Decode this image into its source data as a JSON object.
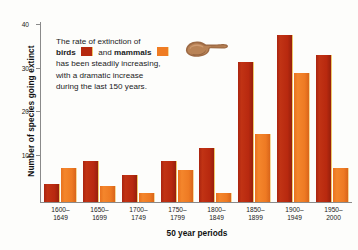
{
  "chart_data": {
    "type": "bar",
    "title": "",
    "xlabel": "50 year periods",
    "ylabel": "Number of species going extinct",
    "categories": [
      "1600–1649",
      "1650–1699",
      "1700–1749",
      "1750–1799",
      "1800–1849",
      "1850–1899",
      "1900–1949",
      "1950–2000"
    ],
    "series": [
      {
        "name": "birds",
        "color": "#b5280f",
        "values": [
          4,
          9,
          6,
          9,
          12,
          31,
          37,
          32.5
        ]
      },
      {
        "name": "mammals",
        "color": "#ef7c23",
        "values": [
          7.5,
          3.5,
          2,
          7,
          2,
          15,
          28.5,
          7.5
        ]
      }
    ],
    "ylim": [
      0,
      40
    ],
    "yticks": [
      10,
      20,
      30,
      40
    ],
    "ytick_labels": [
      "10",
      "20",
      "30",
      "40"
    ],
    "grid": false,
    "legend_position": "inline-annotation"
  },
  "axis": {
    "y_title": "Number of species going extinct",
    "x_title": "50 year periods",
    "y_ticks": [
      {
        "value": 40,
        "label": "40"
      },
      {
        "value": 30,
        "label": "30"
      },
      {
        "value": 20,
        "label": "20"
      },
      {
        "value": 10,
        "label": "10"
      }
    ],
    "x_categories": [
      {
        "line1": "1600–",
        "line2": "1649"
      },
      {
        "line1": "1650–",
        "line2": "1699"
      },
      {
        "line1": "1700–",
        "line2": "1749"
      },
      {
        "line1": "1750–",
        "line2": "1799"
      },
      {
        "line1": "1800–",
        "line2": "1849"
      },
      {
        "line1": "1850–",
        "line2": "1899"
      },
      {
        "line1": "1900–",
        "line2": "1949"
      },
      {
        "line1": "1950–",
        "line2": "2000"
      }
    ]
  },
  "annotation": {
    "line1_a": "The rate of extinction of",
    "line2_a": "birds",
    "line2_b": "and",
    "line2_c": "mammals",
    "line3": "has been steadily increasing,",
    "line4": "with a dramatic increase",
    "line5": "during the last 150 years."
  },
  "icons": {
    "pointing_hand": "pointing-hand-icon"
  },
  "colors": {
    "birds": "#b5280f",
    "mammals": "#ef7c23",
    "axis": "#8a8a8a",
    "text": "#1a1a1a",
    "background": "#fdfdfb"
  }
}
